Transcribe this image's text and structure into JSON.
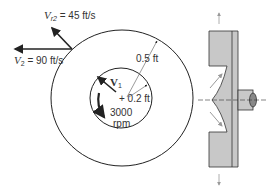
{
  "labels": {
    "vr2": {
      "symbol": "V",
      "subscript": "r2",
      "value": "= 45 ft/s"
    },
    "v2": {
      "symbol": "V",
      "subscript": "2",
      "value": "= 90 ft/s"
    },
    "v1": {
      "symbol": "V",
      "subscript": "1"
    },
    "outer_radius": "0.5 ft",
    "inner_radius": "+ 0.2 ft",
    "speed_value": "3000",
    "speed_unit": "rpm"
  },
  "colors": {
    "line": "#222222",
    "fill_gray": "#c8c8c8",
    "arrow_gray": "#999999"
  }
}
